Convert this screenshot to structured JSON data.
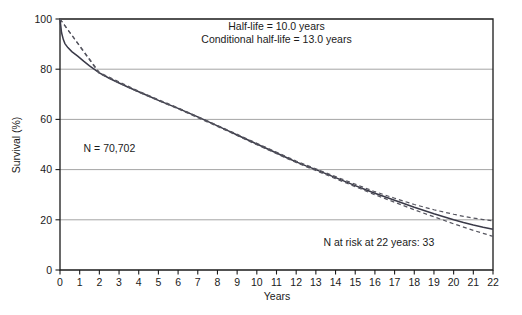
{
  "chart_data": {
    "type": "line",
    "title": "",
    "xlabel": "Years",
    "ylabel": "Survival (%)",
    "xlim": [
      0,
      22
    ],
    "ylim": [
      0,
      100
    ],
    "grid": true,
    "legend": "none",
    "x_ticks": [
      0,
      1,
      2,
      3,
      4,
      5,
      6,
      7,
      8,
      9,
      10,
      11,
      12,
      13,
      14,
      15,
      16,
      17,
      18,
      19,
      20,
      21,
      22
    ],
    "y_ticks": [
      0,
      20,
      40,
      60,
      80,
      100
    ],
    "annotations": [
      {
        "name": "half-life",
        "text": "Half-life = 10.0 years",
        "x": 11.0,
        "y": 95.5
      },
      {
        "name": "conditional-half-life",
        "text": "Conditional half-life = 13.0 years",
        "x": 11.0,
        "y": 90.5
      },
      {
        "name": "sample-size",
        "text": "N = 70,702",
        "x": 1.2,
        "y": 47.0
      },
      {
        "name": "n-at-risk",
        "text": "N at risk at 22 years: 33",
        "x": 16.2,
        "y": 9.5
      }
    ],
    "series": [
      {
        "name": "Survival",
        "style": "solid",
        "x": [
          0,
          0.08,
          0.17,
          0.25,
          0.4,
          0.6,
          0.9,
          1.2,
          1.5,
          2,
          2.5,
          3,
          3.5,
          4,
          4.5,
          5,
          5.5,
          6,
          6.5,
          7,
          7.5,
          8,
          8.5,
          9,
          9.5,
          10,
          10.5,
          11,
          11.5,
          12,
          12.5,
          13,
          13.5,
          14,
          14.5,
          15,
          15.5,
          16,
          16.5,
          17,
          17.5,
          18,
          18.5,
          19,
          19.5,
          20,
          20.5,
          21,
          21.5,
          22
        ],
        "y": [
          100,
          94.5,
          91.8,
          90.2,
          88.6,
          87.0,
          85.2,
          83.2,
          81.3,
          78.5,
          76.4,
          74.5,
          72.7,
          71.0,
          69.3,
          67.6,
          66.0,
          64.4,
          62.7,
          61.0,
          59.2,
          57.4,
          55.6,
          53.8,
          52.0,
          50.2,
          48.4,
          46.6,
          44.8,
          43.1,
          41.5,
          40.0,
          38.4,
          36.8,
          35.2,
          33.6,
          32.1,
          30.6,
          29.2,
          27.8,
          26.4,
          25.0,
          23.7,
          22.4,
          21.2,
          20.0,
          18.9,
          17.9,
          17.0,
          16.2
        ]
      },
      {
        "name": "Upper confidence band",
        "style": "dashed",
        "x": [
          0,
          2,
          4,
          6,
          8,
          10,
          12,
          14,
          16,
          17,
          18,
          19,
          19.5,
          20,
          20.5,
          21,
          21.5,
          22
        ],
        "y": [
          100,
          78.7,
          71.2,
          64.6,
          57.6,
          50.5,
          43.4,
          37.2,
          31.2,
          28.6,
          26.1,
          24.0,
          23.1,
          22.2,
          21.4,
          20.7,
          20.1,
          19.6
        ]
      },
      {
        "name": "Lower confidence band",
        "style": "dashed",
        "x": [
          0,
          2,
          4,
          6,
          8,
          10,
          12,
          14,
          16,
          17,
          18,
          19,
          19.5,
          20,
          20.5,
          21,
          21.5,
          22
        ],
        "y": [
          100,
          78.3,
          70.8,
          64.2,
          57.2,
          49.9,
          42.8,
          36.4,
          30.0,
          27.0,
          24.0,
          21.2,
          19.8,
          18.4,
          17.1,
          15.8,
          14.6,
          13.4
        ]
      }
    ]
  }
}
